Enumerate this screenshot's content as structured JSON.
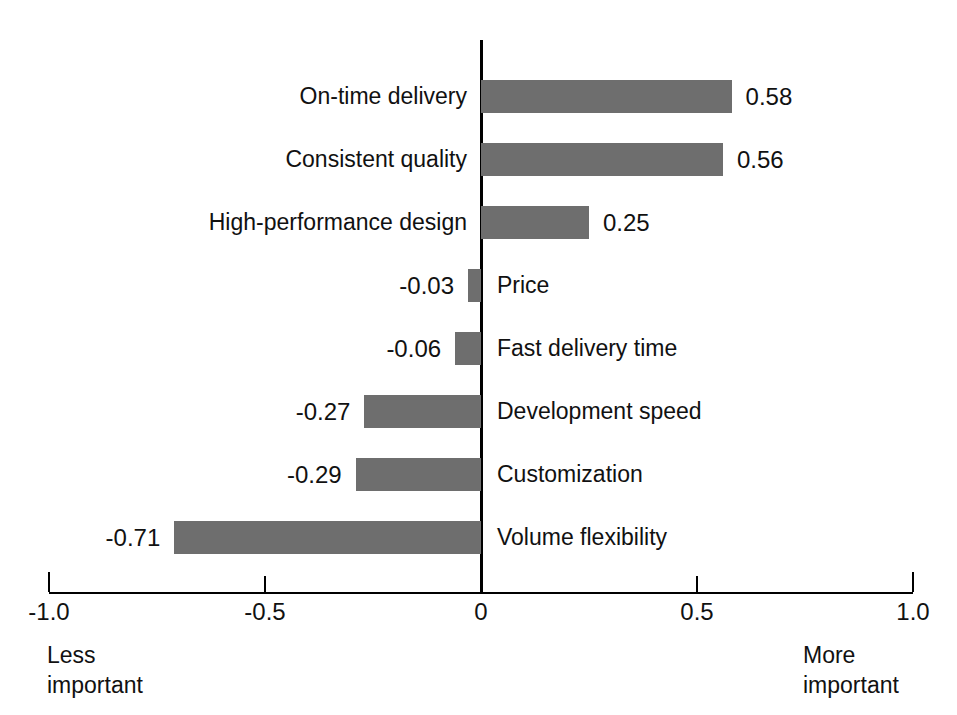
{
  "chart_data": {
    "type": "bar",
    "orientation": "horizontal",
    "title": "",
    "subtitle": "",
    "xlabel": "",
    "ylabel": "",
    "xlim": [
      -1.0,
      1.0
    ],
    "grid": false,
    "legend": null,
    "bar_color": "#6e6e6e",
    "axis_color": "#000000",
    "tick_labels": [
      "-1.0",
      "-0.5",
      "0",
      "0.5",
      "1.0"
    ],
    "tick_values": [
      -1.0,
      -0.5,
      0,
      0.5,
      1.0
    ],
    "categories": [
      "On-time delivery",
      "Consistent quality",
      "High-performance design",
      "Price",
      "Fast delivery time",
      "Development speed",
      "Customization",
      "Volume flexibility"
    ],
    "values": [
      0.58,
      0.56,
      0.25,
      -0.03,
      -0.06,
      -0.27,
      -0.29,
      -0.71
    ],
    "value_labels": [
      "0.58",
      "0.56",
      "0.25",
      "-0.03",
      "-0.06",
      "-0.27",
      "-0.29",
      "-0.71"
    ],
    "annotations": {
      "left_axis_note": "Less\nimportant",
      "right_axis_note": "More\nimportant"
    }
  },
  "axis": {
    "left_note_line1": "Less",
    "left_note_line2": "important",
    "right_note_line1": "More",
    "right_note_line2": "important"
  }
}
